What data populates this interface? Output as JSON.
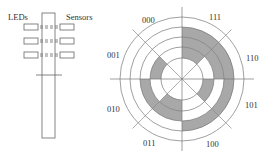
{
  "left_diagram": {
    "leds_label": "LEDs",
    "sensors_label": "Sensors",
    "pairs": 3
  },
  "disk": {
    "sectors": [
      {
        "label": "111",
        "bits": [
          1,
          1,
          1
        ]
      },
      {
        "label": "110",
        "bits": [
          1,
          1,
          0
        ]
      },
      {
        "label": "101",
        "bits": [
          1,
          0,
          1
        ]
      },
      {
        "label": "100",
        "bits": [
          1,
          0,
          0
        ]
      },
      {
        "label": "011",
        "bits": [
          0,
          1,
          1
        ]
      },
      {
        "label": "010",
        "bits": [
          0,
          1,
          0
        ]
      },
      {
        "label": "001",
        "bits": [
          0,
          0,
          1
        ]
      },
      {
        "label": "000",
        "bits": [
          0,
          0,
          0
        ]
      }
    ],
    "fill_color": "#a8a8a8",
    "line_color": "#777777"
  }
}
